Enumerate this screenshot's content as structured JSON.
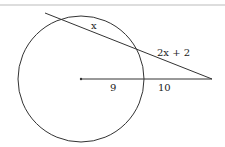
{
  "diagram": {
    "type": "circle-secant-segments",
    "colors": {
      "stroke": "#333333",
      "top_rule": "#bbbbbb",
      "background": "#ffffff"
    },
    "labels": {
      "internal_secant_chord": "x",
      "external_secant_segment": "2x + 2",
      "radius": "9",
      "external_radius_extension": "10"
    },
    "circle": {
      "cx": 81,
      "cy": 79,
      "r": 63
    },
    "external_point": {
      "x": 212,
      "y": 79
    }
  }
}
